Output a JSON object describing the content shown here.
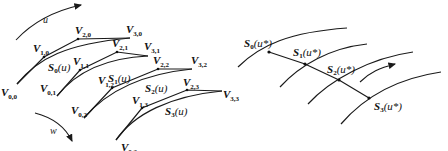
{
  "left_panel": {
    "direction_labels": {
      "u": "u",
      "w": "w"
    },
    "control_points": [
      {
        "id": "V00",
        "main": "V",
        "sub": "0,0"
      },
      {
        "id": "V10",
        "main": "V",
        "sub": "1,0"
      },
      {
        "id": "V20",
        "main": "V",
        "sub": "2,0"
      },
      {
        "id": "V30",
        "main": "V",
        "sub": "3,0"
      },
      {
        "id": "V01",
        "main": "V",
        "sub": "0,1"
      },
      {
        "id": "V11",
        "main": "V",
        "sub": "1,1"
      },
      {
        "id": "V21",
        "main": "V",
        "sub": "2,1"
      },
      {
        "id": "V31",
        "main": "V",
        "sub": "3,1"
      },
      {
        "id": "V02",
        "main": "V",
        "sub": "0,2"
      },
      {
        "id": "V12",
        "main": "V",
        "sub": "1,2"
      },
      {
        "id": "V22",
        "main": "V",
        "sub": "2,2"
      },
      {
        "id": "V32",
        "main": "V",
        "sub": "3,2"
      },
      {
        "id": "V03",
        "main": "V",
        "sub": "0,3"
      },
      {
        "id": "V13",
        "main": "V",
        "sub": "1,3"
      },
      {
        "id": "V23",
        "main": "V",
        "sub": "2,3"
      },
      {
        "id": "V33",
        "main": "V",
        "sub": "3,3"
      }
    ],
    "curves": [
      {
        "main": "S",
        "sub": "0",
        "arg": "(u)"
      },
      {
        "main": "S",
        "sub": "1",
        "arg": "(u)"
      },
      {
        "main": "S",
        "sub": "2",
        "arg": "(u)"
      },
      {
        "main": "S",
        "sub": "3",
        "arg": "(u)"
      }
    ]
  },
  "right_panel": {
    "points": [
      {
        "main": "S",
        "sub": "0",
        "arg": "(u*)"
      },
      {
        "main": "S",
        "sub": "1",
        "arg": "(u*)"
      },
      {
        "main": "S",
        "sub": "2",
        "arg": "(u*)"
      },
      {
        "main": "S",
        "sub": "3",
        "arg": "(u*)"
      }
    ]
  }
}
